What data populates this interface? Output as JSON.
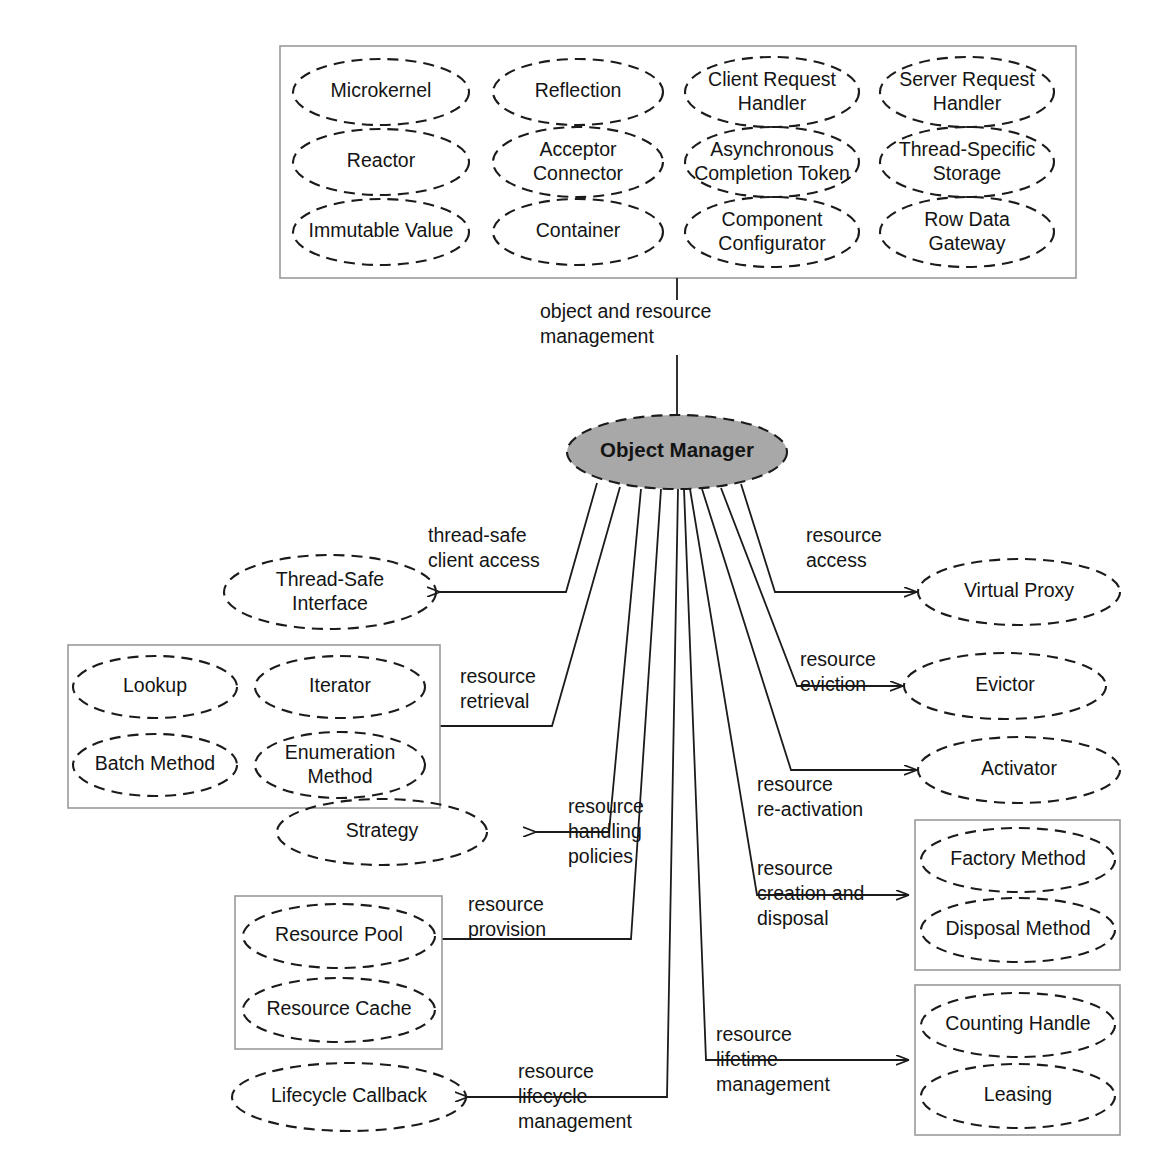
{
  "diagram": {
    "center": {
      "label": "Object Manager",
      "fill": "#a8a8a8",
      "stroke": "#1b1b1b"
    },
    "top_link": {
      "label_line1": "object and resource",
      "label_line2": "management"
    },
    "top_group": {
      "name": "object-and-resource-management-patterns",
      "patterns": [
        {
          "id": "microkernel",
          "lines": [
            "Microkernel"
          ]
        },
        {
          "id": "reflection",
          "lines": [
            "Reflection"
          ]
        },
        {
          "id": "client-request-handler",
          "lines": [
            "Client Request",
            "Handler"
          ]
        },
        {
          "id": "server-request-handler",
          "lines": [
            "Server Request",
            "Handler"
          ]
        },
        {
          "id": "reactor",
          "lines": [
            "Reactor"
          ]
        },
        {
          "id": "acceptor-connector",
          "lines": [
            "Acceptor",
            "Connector"
          ]
        },
        {
          "id": "asynchronous-completion-token",
          "lines": [
            "Asynchronous",
            "Completion Token"
          ]
        },
        {
          "id": "thread-specific-storage",
          "lines": [
            "Thread-Specific",
            "Storage"
          ]
        },
        {
          "id": "immutable-value",
          "lines": [
            "Immutable Value"
          ]
        },
        {
          "id": "container",
          "lines": [
            "Container"
          ]
        },
        {
          "id": "component-configurator",
          "lines": [
            "Component",
            "Configurator"
          ]
        },
        {
          "id": "row-data-gateway",
          "lines": [
            "Row Data",
            "Gateway"
          ]
        }
      ]
    },
    "branches": [
      {
        "id": "thread-safe-client-access",
        "label_lines": [
          "thread-safe",
          "client access"
        ],
        "side": "left",
        "targets": [
          {
            "id": "thread-safe-interface",
            "lines": [
              "Thread-Safe",
              "Interface"
            ]
          }
        ],
        "boxed": false
      },
      {
        "id": "resource-retrieval",
        "label_lines": [
          "resource",
          "retrieval"
        ],
        "side": "left",
        "targets": [
          {
            "id": "lookup",
            "lines": [
              "Lookup"
            ]
          },
          {
            "id": "iterator",
            "lines": [
              "Iterator"
            ]
          },
          {
            "id": "batch-method",
            "lines": [
              "Batch Method"
            ]
          },
          {
            "id": "enumeration-method",
            "lines": [
              "Enumeration",
              "Method"
            ]
          }
        ],
        "boxed": true
      },
      {
        "id": "resource-handling-policies",
        "label_lines": [
          "resource",
          "handling",
          "policies"
        ],
        "side": "left",
        "targets": [
          {
            "id": "strategy",
            "lines": [
              "Strategy"
            ]
          }
        ],
        "boxed": false
      },
      {
        "id": "resource-provision",
        "label_lines": [
          "resource",
          "provision"
        ],
        "side": "left",
        "targets": [
          {
            "id": "resource-pool",
            "lines": [
              "Resource Pool"
            ]
          },
          {
            "id": "resource-cache",
            "lines": [
              "Resource Cache"
            ]
          }
        ],
        "boxed": true
      },
      {
        "id": "resource-lifecycle-management",
        "label_lines": [
          "resource",
          "lifecycle",
          "management"
        ],
        "side": "left",
        "targets": [
          {
            "id": "lifecycle-callback",
            "lines": [
              "Lifecycle Callback"
            ]
          }
        ],
        "boxed": false
      },
      {
        "id": "resource-access",
        "label_lines": [
          "resource",
          "access"
        ],
        "side": "right",
        "targets": [
          {
            "id": "virtual-proxy",
            "lines": [
              "Virtual Proxy"
            ]
          }
        ],
        "boxed": false
      },
      {
        "id": "resource-eviction",
        "label_lines": [
          "resource",
          "eviction"
        ],
        "side": "right",
        "targets": [
          {
            "id": "evictor",
            "lines": [
              "Evictor"
            ]
          }
        ],
        "boxed": false
      },
      {
        "id": "resource-re-activation",
        "label_lines": [
          "resource",
          "re-activation"
        ],
        "side": "right",
        "targets": [
          {
            "id": "activator",
            "lines": [
              "Activator"
            ]
          }
        ],
        "boxed": false
      },
      {
        "id": "resource-creation-and-disposal",
        "label_lines": [
          "resource",
          "creation and",
          "disposal"
        ],
        "side": "right",
        "targets": [
          {
            "id": "factory-method",
            "lines": [
              "Factory Method"
            ]
          },
          {
            "id": "disposal-method",
            "lines": [
              "Disposal Method"
            ]
          }
        ],
        "boxed": true
      },
      {
        "id": "resource-lifetime-management",
        "label_lines": [
          "resource",
          "lifetime",
          "management"
        ],
        "side": "right",
        "targets": [
          {
            "id": "counting-handle",
            "lines": [
              "Counting Handle"
            ]
          },
          {
            "id": "leasing",
            "lines": [
              "Leasing"
            ]
          }
        ],
        "boxed": true
      }
    ],
    "colors": {
      "ellipse_stroke": "#1b1b1b",
      "group_box_stroke": "#9a9a9a",
      "connector": "#1b1b1b",
      "center_fill": "#a8a8a8",
      "text": "#141414",
      "background": "#ffffff"
    }
  }
}
